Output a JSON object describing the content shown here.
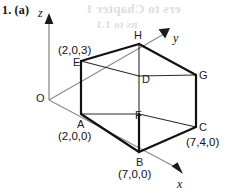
{
  "figure": {
    "question_number": "1. (a)",
    "origin_label": "O",
    "axes": [
      {
        "name": "z",
        "label": "z"
      },
      {
        "name": "y",
        "label": "y"
      },
      {
        "name": "x",
        "label": "x"
      }
    ],
    "vertices": [
      {
        "name": "A",
        "label": "A",
        "coord": "(2,0,0)"
      },
      {
        "name": "B",
        "label": "B",
        "coord": "(7,0,0)"
      },
      {
        "name": "C",
        "label": "C",
        "coord": "(7,4,0)"
      },
      {
        "name": "D",
        "label": "D",
        "coord": ""
      },
      {
        "name": "E",
        "label": "E",
        "coord": "(2,0,3)"
      },
      {
        "name": "F",
        "label": "F",
        "coord": ""
      },
      {
        "name": "G",
        "label": "G",
        "coord": ""
      },
      {
        "name": "H",
        "label": "H",
        "coord": ""
      }
    ],
    "bleed_through": {
      "line1": "ers to Chapter 1",
      "line2": "ns to 1.1"
    },
    "colors": {
      "ink": "#111111",
      "axis": "#7a7a7a",
      "paper": "#ffffff",
      "bleed": "#d9d9d9"
    }
  }
}
